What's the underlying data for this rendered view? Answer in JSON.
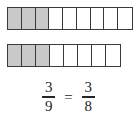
{
  "figure": {
    "colors": {
      "shaded_fill": "#c9c9c9",
      "unshaded_fill": "#ffffff",
      "border": "#3a3a3a",
      "text": "#262626"
    },
    "bars": [
      {
        "name": "bar-nine",
        "total_cells": 9,
        "shaded_cells": 3,
        "label": "nine-part bar with three parts shaded"
      },
      {
        "name": "bar-eight",
        "total_cells": 8,
        "shaded_cells": 3,
        "label": "eight-part bar with three parts shaded"
      }
    ]
  },
  "equation": {
    "left_fraction": {
      "numerator": "3",
      "denominator": "9"
    },
    "relation": "=",
    "right_fraction": {
      "numerator": "3",
      "denominator": "8"
    },
    "full_text": "3/9 = 3/8"
  },
  "chart_data": {
    "type": "bar",
    "categories": [
      "3/9",
      "3/8"
    ],
    "series": [
      {
        "name": "shaded parts",
        "values": [
          3,
          3
        ]
      },
      {
        "name": "total parts",
        "values": [
          9,
          8
        ]
      }
    ],
    "xlabel": "",
    "ylabel": "",
    "grid": false,
    "legend": "none"
  }
}
